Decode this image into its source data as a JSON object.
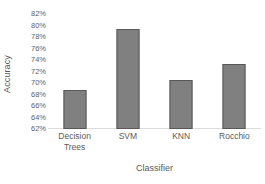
{
  "chart_data": {
    "type": "bar",
    "title": "",
    "xlabel": "Classifier",
    "ylabel": "Accuracy",
    "categories": [
      "Decision Trees",
      "SVM",
      "KNN",
      "Rocchio"
    ],
    "category_lines": [
      [
        "Decision",
        "Trees"
      ],
      [
        "SVM"
      ],
      [
        "KNN"
      ],
      [
        "Rocchio"
      ]
    ],
    "values": [
      69.0,
      80.0,
      70.8,
      73.8
    ],
    "value_labels": [
      "69%",
      "80%",
      "70.8%",
      "73.8%"
    ],
    "ylim": [
      62,
      82
    ],
    "ytick_values": [
      62,
      64,
      66,
      68,
      70,
      72,
      74,
      76,
      78,
      80,
      82
    ],
    "ytick_labels": [
      "62%",
      "64%",
      "66%",
      "68%",
      "70%",
      "72%",
      "74%",
      "76%",
      "78%",
      "80%",
      "82%"
    ],
    "grid": false,
    "legend": null,
    "legend_position": "none",
    "bar_fill_color": "#808080",
    "bar_border_color": "#585858",
    "baseline_color": "#dcdcdc",
    "background_color": "#ffffff"
  }
}
